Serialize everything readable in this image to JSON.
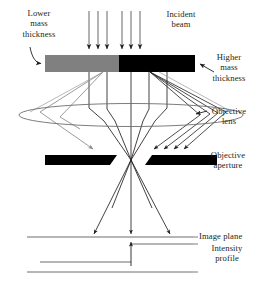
{
  "figure": {
    "type": "optics-ray-diagram",
    "background_color": "#ffffff",
    "ink_color": "#231f20"
  },
  "labels": {
    "lower_mass_thickness": "Lower\nmass\nthickness",
    "incident_beam": "Incident\nbeam",
    "higher_mass_thickness": "Higher\nmass\nthickness",
    "objective_lens": "Objective\nlens",
    "objective_aperture": "Objective\naperture",
    "image_plane": "Image plane",
    "intensity_profile": "Intensity\nprofile"
  },
  "elements": {
    "specimen": {
      "name": "specimen-bar",
      "left_segment": {
        "label_ref": "lower_mass_thickness",
        "fill": "#808080",
        "x": 45,
        "y": 55,
        "width": 74,
        "height": 17
      },
      "right_segment": {
        "label_ref": "higher_mass_thickness",
        "fill": "#000000",
        "x": 119,
        "y": 55,
        "width": 76,
        "height": 17
      }
    },
    "incident_beam": {
      "name": "incident-beam-rays",
      "ray_count": 6,
      "x_positions": [
        89,
        98,
        107,
        122,
        131,
        140
      ],
      "y_start": 12,
      "y_end": 53,
      "arrowhead": "down"
    },
    "objective_lens": {
      "name": "objective-lens-ellipse",
      "cx": 131,
      "cy": 115,
      "rx": 112,
      "ry": 12,
      "stroke": "#555555"
    },
    "objective_aperture": {
      "name": "objective-aperture-blades",
      "fill": "#000000",
      "left_blade": {
        "x": 45,
        "y": 155,
        "width": 72,
        "height": 10
      },
      "right_blade": {
        "x": 145,
        "y": 155,
        "width": 72,
        "height": 10
      },
      "gap_center_x": 131
    },
    "image_plane": {
      "name": "image-plane-line",
      "x1": 27,
      "x2": 193,
      "y": 237
    },
    "intensity_profile": {
      "name": "intensity-profile-trace",
      "step_x": 131,
      "low_level_y": 262,
      "high_level_y": 244,
      "baseline_y": 272,
      "low_x_start": 40,
      "high_x_end": 193,
      "baseline_x_start": 27,
      "baseline_x_end": 193,
      "description": "Step: low intensity under higher mass thickness side, high intensity under lower mass thickness side"
    },
    "scattered_rays": {
      "name": "scattered-ray-bundles",
      "thin_side": {
        "count": 1,
        "blocked_by": "left-aperture-blade",
        "color": "#8a8a8a"
      },
      "thick_side": {
        "count": 4,
        "blocked_by": "right-aperture-blade",
        "color": "#231f20"
      }
    },
    "transmitted_rays": {
      "name": "transmitted-ray-cone",
      "crossover_x": 131,
      "crossover_y": 160,
      "reaches": "image-plane"
    }
  }
}
